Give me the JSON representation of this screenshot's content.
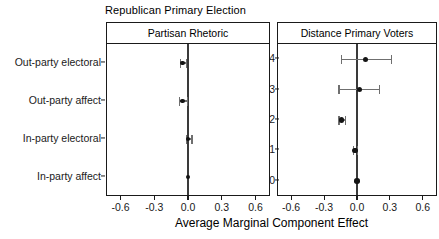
{
  "figure": {
    "title": "Republican Primary Election",
    "axis_title": "Average Marginal Component Effect"
  },
  "panels": [
    {
      "strip_label": "Partisan Rhetoric"
    },
    {
      "strip_label": "Distance Primary Voters"
    }
  ],
  "y_labels_left": [
    "Out-party electoral",
    "Out-party affect",
    "In-party electoral",
    "In-party affect"
  ],
  "y_labels_right": [
    "4",
    "3",
    "2",
    "1",
    "0"
  ],
  "x_tick_labels": [
    "-0.6",
    "-0.3",
    "0.0",
    "0.3",
    "0.6"
  ],
  "colors": {
    "point": "#141414",
    "errorbar": "#6f6f6f",
    "zeroline": "#3a3a3a",
    "axis": "#1a1a1a",
    "background": "#ffffff"
  },
  "chart_data": {
    "type": "scatter",
    "title": "Republican Primary Election",
    "xlabel": "Average Marginal Component Effect",
    "ylabel": "",
    "xlim": [
      -0.72,
      0.72
    ],
    "xticks": [
      -0.6,
      -0.3,
      0.0,
      0.3,
      0.6
    ],
    "xtick_labels": [
      "-0.6",
      "-0.3",
      "0.0",
      "0.3",
      "0.6"
    ],
    "grid": false,
    "legend": null,
    "reference_line_x": 0.0,
    "panels": [
      {
        "name": "Partisan Rhetoric",
        "categories": [
          "Out-party electoral",
          "Out-party affect",
          "In-party electoral",
          "In-party affect"
        ],
        "points": [
          {
            "label": "Out-party electoral",
            "estimate": -0.05,
            "ci_low": -0.07,
            "ci_high": -0.02
          },
          {
            "label": "Out-party affect",
            "estimate": -0.05,
            "ci_low": -0.08,
            "ci_high": -0.01
          },
          {
            "label": "In-party electoral",
            "estimate": 0.0,
            "ci_low": -0.02,
            "ci_high": 0.03
          },
          {
            "label": "In-party affect",
            "estimate": 0.0,
            "ci_low": 0.0,
            "ci_high": 0.0
          }
        ]
      },
      {
        "name": "Distance Primary Voters",
        "categories": [
          "4",
          "3",
          "2",
          "1",
          "0"
        ],
        "points": [
          {
            "label": "4",
            "estimate": 0.08,
            "ci_low": -0.15,
            "ci_high": 0.31
          },
          {
            "label": "3",
            "estimate": 0.02,
            "ci_low": -0.17,
            "ci_high": 0.2
          },
          {
            "label": "2",
            "estimate": -0.14,
            "ci_low": -0.17,
            "ci_high": -0.11
          },
          {
            "label": "1",
            "estimate": -0.02,
            "ci_low": -0.04,
            "ci_high": 0.0
          },
          {
            "label": "0",
            "estimate": 0.0,
            "ci_low": 0.0,
            "ci_high": 0.0
          }
        ]
      }
    ]
  }
}
